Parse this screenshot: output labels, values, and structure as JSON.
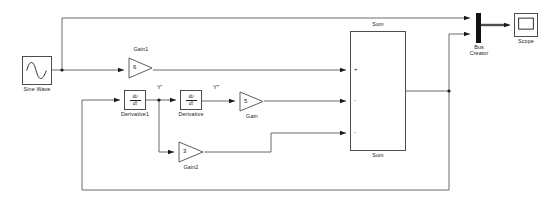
{
  "diagram": {
    "background": "#ffffff",
    "wire_color": "#4d4d4d",
    "bus_color": "#111111",
    "block_border": "#4d4d4d",
    "text_color": "#1a1a1a"
  },
  "blocks": {
    "sine_wave": {
      "label": "Sine Wave",
      "icon": "sine-wave-icon",
      "x": 22,
      "y": 56,
      "w": 30,
      "h": 29
    },
    "gain1": {
      "label": "Gain1",
      "value": "6",
      "icon": "triangle-gain-icon",
      "x": 128,
      "y": 57,
      "w": 25,
      "h": 22
    },
    "derivative1": {
      "label": "Derivative1",
      "numerator": "du",
      "denominator": "dt",
      "icon": "derivative-icon",
      "x": 124,
      "y": 90,
      "w": 22,
      "h": 20
    },
    "derivative": {
      "label": "Derivative",
      "numerator": "du",
      "denominator": "dt",
      "icon": "derivative-icon",
      "x": 180,
      "y": 90,
      "w": 22,
      "h": 20
    },
    "gain": {
      "label": "Gain",
      "value": "5",
      "icon": "triangle-gain-icon",
      "x": 239,
      "y": 91,
      "w": 25,
      "h": 21
    },
    "gain2": {
      "label": "Gain2",
      "value": "3",
      "icon": "triangle-gain-icon",
      "x": 178,
      "y": 141,
      "w": 26,
      "h": 22
    },
    "sum": {
      "label_top": "Sum",
      "label_bottom": "Sum",
      "signs": [
        "+",
        "-",
        "-"
      ],
      "x": 350,
      "y": 31,
      "w": 56,
      "h": 120
    },
    "bus_creator": {
      "label_line1": "Bus",
      "label_line2": "Creator",
      "icon": "bus-creator-icon",
      "x": 476,
      "y": 13,
      "w": 5,
      "h": 30
    },
    "scope": {
      "label": "Scope",
      "icon": "scope-icon",
      "x": 514,
      "y": 13,
      "w": 24,
      "h": 24
    }
  },
  "signal_labels": [
    {
      "text": "Y′",
      "x": 157,
      "y": 86
    },
    {
      "text": "Y″",
      "x": 213,
      "y": 86
    }
  ],
  "ports": {
    "sum_inputs": [
      {
        "sign": "+",
        "x": 409,
        "y": 70
      },
      {
        "sign": "-",
        "x": 409,
        "y": 103
      },
      {
        "sign": "-",
        "x": 409,
        "y": 134
      }
    ]
  },
  "junctions": [
    {
      "name": "sine-branch-junction",
      "x": 62,
      "y": 70
    },
    {
      "name": "y-prime-junction",
      "x": 159,
      "y": 100
    },
    {
      "name": "sum-output-junction",
      "x": 449,
      "y": 91
    }
  ]
}
